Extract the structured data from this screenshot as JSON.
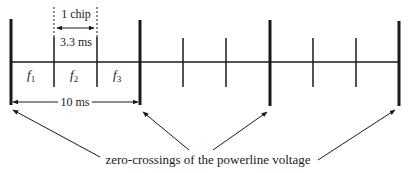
{
  "diagram": {
    "chip_label": "1 chip",
    "chip_duration": "3.3 ms",
    "half_cycle_duration": "10 ms",
    "frequency_labels": [
      {
        "base": "f",
        "sub": "1"
      },
      {
        "base": "f",
        "sub": "2"
      },
      {
        "base": "f",
        "sub": "3"
      }
    ],
    "caption": "zero-crossings of the powerline voltage",
    "colors": {
      "line": "#1a1a1a",
      "background": "#ffffff"
    }
  }
}
